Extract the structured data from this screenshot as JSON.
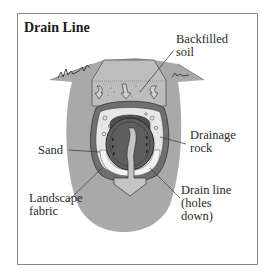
{
  "title": "Drain Line",
  "labels": {
    "backfilled_soil": "Backfilled\nsoil",
    "drainage_rock": "Drainage\nrock",
    "sand": "Sand",
    "landscape_fabric": "Landscape\nfabric",
    "drain_line": "Drain line\n(holes\ndown)"
  },
  "colors": {
    "frame_border": "#8a8a8a",
    "ground": "#a9a9a9",
    "trench_fill": "#bdbdbd",
    "fabric": "#6f6f6f",
    "rock_bg": "#e6e6e6",
    "pipe": "#5e5e5e",
    "pipe_top": "#4f4f4f",
    "water_arrow": "#c4c4c4",
    "line": "#333333"
  }
}
